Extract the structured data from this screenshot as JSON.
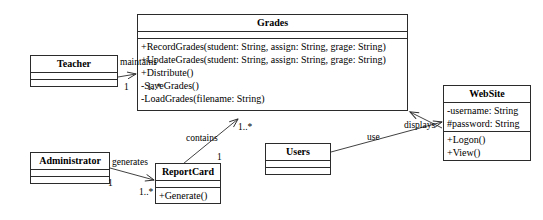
{
  "diagram": {
    "stroke_color": "#2b2b2b",
    "background_color": "#ffffff",
    "classes": [
      {
        "id": "grades",
        "name": "Grades",
        "attributes": [],
        "operations": [
          "+RecordGrades(student: String, assign: String, grage: String)",
          "+UpdateGrades(student: String, assign: String, grage: String)",
          "+Distribute()",
          "-SaveGrades()",
          "-LoadGrades(filename: String)"
        ]
      },
      {
        "id": "teacher",
        "name": "Teacher",
        "attributes": [],
        "operations": []
      },
      {
        "id": "website",
        "name": "WebSite",
        "attributes": [
          "-username: String",
          "#password: String"
        ],
        "operations": [
          "+Logon()",
          "+View()"
        ]
      },
      {
        "id": "administrator",
        "name": "Administrator",
        "attributes": [],
        "operations": []
      },
      {
        "id": "reportcard",
        "name": "ReportCard",
        "attributes": [],
        "operations": [
          "+Generate()"
        ]
      },
      {
        "id": "users",
        "name": "Users",
        "attributes": [],
        "operations": []
      }
    ],
    "associations": [
      {
        "id": "teacher-maintains-grades",
        "label": "maintains",
        "source": "teacher",
        "target": "grades",
        "source_multiplicity": "1",
        "target_multiplicity": "1..*"
      },
      {
        "id": "reportcard-contains-grades",
        "label": "contains",
        "source": "reportcard",
        "target": "grades",
        "source_multiplicity": "1",
        "target_multiplicity": "1..*"
      },
      {
        "id": "administrator-generates-reportcard",
        "label": "generates",
        "source": "administrator",
        "target": "reportcard",
        "source_multiplicity": "1",
        "target_multiplicity": "1..*"
      },
      {
        "id": "users-use-website",
        "label": "use",
        "source": "users",
        "target": "website",
        "source_multiplicity": "",
        "target_multiplicity": ""
      },
      {
        "id": "website-displays-grades",
        "label": "displays",
        "source": "website",
        "target": "grades",
        "source_multiplicity": "",
        "target_multiplicity": ""
      }
    ]
  }
}
